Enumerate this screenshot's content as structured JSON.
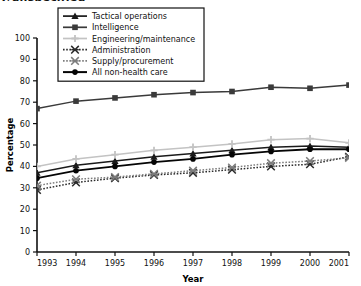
{
  "partial_title": "y/unspecified",
  "chart_data": {
    "type": "line",
    "title": "",
    "xlabel": "Year",
    "ylabel": "Percentage",
    "x": [
      1993,
      1994,
      1995,
      1996,
      1997,
      1998,
      1999,
      2000,
      2001
    ],
    "xticklabels": [
      "1993",
      "1994",
      "1995",
      "1996",
      "1997",
      "1998",
      "1999",
      "2000",
      "2001"
    ],
    "yticklabels": [
      "0",
      "10",
      "20",
      "30",
      "40",
      "50",
      "60",
      "70",
      "80",
      "90",
      "100"
    ],
    "yticks": [
      0,
      10,
      20,
      30,
      40,
      50,
      60,
      70,
      80,
      90,
      100
    ],
    "ylim": [
      0,
      100
    ],
    "xlim": [
      1993,
      2001
    ],
    "grid": false,
    "legend_position": "top-center",
    "series": [
      {
        "name": "Tactical operations",
        "marker": "triangle",
        "linestyle": "solid",
        "color": "#1a1a1a",
        "values": [
          37.0,
          40.5,
          42.5,
          44.5,
          46.0,
          47.5,
          49.0,
          49.5,
          49.0
        ]
      },
      {
        "name": "Intelligence",
        "marker": "square",
        "linestyle": "solid",
        "color": "#3a3a3a",
        "values": [
          67.0,
          70.5,
          72.0,
          73.5,
          74.5,
          75.0,
          77.0,
          76.5,
          78.0
        ]
      },
      {
        "name": "Engineering/maintenance",
        "marker": "plus",
        "linestyle": "solid",
        "color": "#c3c3c3",
        "values": [
          40.0,
          43.5,
          45.5,
          47.5,
          49.0,
          50.5,
          52.5,
          53.0,
          51.0
        ]
      },
      {
        "name": "Administration",
        "marker": "x",
        "linestyle": "dotted",
        "color": "#2b2b2b",
        "values": [
          29.0,
          32.5,
          34.5,
          36.0,
          37.0,
          38.5,
          40.0,
          41.0,
          44.5
        ]
      },
      {
        "name": "Supply/procurement",
        "marker": "x",
        "linestyle": "dotted",
        "color": "#7d7d7d",
        "values": [
          31.0,
          34.0,
          35.0,
          36.5,
          38.0,
          39.5,
          41.5,
          42.5,
          44.0
        ]
      },
      {
        "name": "All non-health care",
        "marker": "circle",
        "linestyle": "solid",
        "color": "#050505",
        "values": [
          34.5,
          38.0,
          40.0,
          42.0,
          43.5,
          45.5,
          47.0,
          48.0,
          48.0
        ]
      }
    ]
  }
}
